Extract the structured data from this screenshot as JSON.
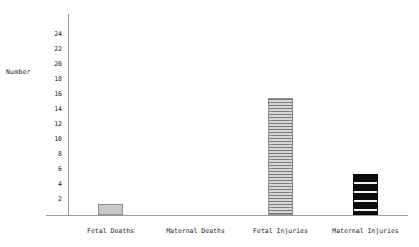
{
  "chart_data": {
    "type": "bar",
    "title": "",
    "xlabel": "",
    "ylabel": "Number",
    "categories": [
      "Fetal Deaths",
      "Maternal Deaths",
      "Fetal Injuries",
      "Maternal Injuries"
    ],
    "values": [
      1.5,
      0,
      15.5,
      5.5
    ],
    "ylim": [
      0,
      25
    ],
    "ytick_labels": [
      "24",
      "22",
      "20",
      "18",
      "16",
      "14",
      "12",
      "10",
      "8",
      "6",
      "4",
      "2"
    ],
    "ytick_values": [
      24,
      22,
      20,
      18,
      16,
      14,
      12,
      10,
      8,
      6,
      4,
      2
    ],
    "grid": false,
    "legend": "none",
    "bar_styles": [
      "solid-gray",
      "none",
      "horizontal-hatch-fine",
      "black-horizontal-bands"
    ],
    "colors": {
      "bar_fetal_deaths": "#c9c9c9",
      "bar_fetal_injuries": "#d2d2d2",
      "bar_maternal_injuries": "#0b0b0b",
      "axis": "#9a9a9a",
      "text": "#1a1a1a",
      "background": "#ffffff"
    }
  }
}
